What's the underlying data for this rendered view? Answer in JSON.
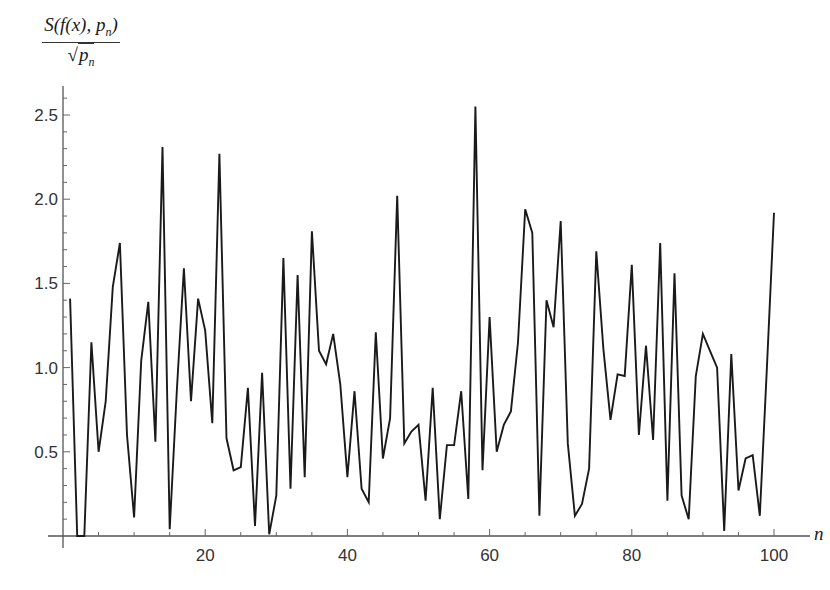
{
  "chart_data": {
    "type": "line",
    "title": "",
    "xlabel": "n",
    "ylabel": "S(f(x), p_n) / sqrt(p_n)",
    "ylabel_parts": {
      "numerator": "S(f(x), p",
      "numerator_sub": "n",
      "numerator_end": ")",
      "sqrt_symbol": "√",
      "denominator": "p",
      "denominator_sub": "n"
    },
    "xlim": [
      0,
      101
    ],
    "ylim": [
      0,
      2.7
    ],
    "x_ticks": [
      20,
      40,
      60,
      80,
      100
    ],
    "x_tick_labels": [
      "20",
      "40",
      "60",
      "80",
      "100"
    ],
    "y_ticks": [
      0.5,
      1.0,
      1.5,
      2.0,
      2.5
    ],
    "y_tick_labels": [
      "0.5",
      "1.0",
      "1.5",
      "2.0",
      "2.5"
    ],
    "grid": false,
    "legend": null,
    "series": [
      {
        "name": "S(f(x), p_n)/sqrt(p_n)",
        "color": "#1a1a1a",
        "x": [
          1,
          2,
          3,
          4,
          5,
          6,
          7,
          8,
          9,
          10,
          11,
          12,
          13,
          14,
          15,
          16,
          17,
          18,
          19,
          20,
          21,
          22,
          23,
          24,
          25,
          26,
          27,
          28,
          29,
          30,
          31,
          32,
          33,
          34,
          35,
          36,
          37,
          38,
          39,
          40,
          41,
          42,
          43,
          44,
          45,
          46,
          47,
          48,
          49,
          50,
          51,
          52,
          53,
          54,
          55,
          56,
          57,
          58,
          59,
          60,
          61,
          62,
          63,
          64,
          65,
          66,
          67,
          68,
          69,
          70,
          71,
          72,
          73,
          74,
          75,
          76,
          77,
          78,
          79,
          80,
          81,
          82,
          83,
          84,
          85,
          86,
          87,
          88,
          89,
          90,
          91,
          92,
          93,
          94,
          95,
          96,
          97,
          98,
          99,
          100
        ],
        "values": [
          1.41,
          0.0,
          0.0,
          1.15,
          0.5,
          0.8,
          1.48,
          1.74,
          0.6,
          0.11,
          1.04,
          1.39,
          0.56,
          2.31,
          0.04,
          0.86,
          1.59,
          0.8,
          1.41,
          1.22,
          0.67,
          2.27,
          0.58,
          0.39,
          0.41,
          0.88,
          0.06,
          0.97,
          0.01,
          0.24,
          1.65,
          0.28,
          1.55,
          0.35,
          1.81,
          1.1,
          1.02,
          1.2,
          0.9,
          0.35,
          0.86,
          0.28,
          0.2,
          1.21,
          0.46,
          0.7,
          2.02,
          0.55,
          0.62,
          0.66,
          0.21,
          0.88,
          0.1,
          0.54,
          0.54,
          0.86,
          0.22,
          2.55,
          0.39,
          1.3,
          0.5,
          0.66,
          0.74,
          1.15,
          1.94,
          1.8,
          0.12,
          1.4,
          1.24,
          1.87,
          0.55,
          0.12,
          0.19,
          0.4,
          1.69,
          1.11,
          0.69,
          0.96,
          0.95,
          1.61,
          0.6,
          1.13,
          0.57,
          1.74,
          0.21,
          1.56,
          0.24,
          0.1,
          0.95,
          1.2,
          1.1,
          1.0,
          0.03,
          1.08,
          0.27,
          0.46,
          0.48,
          0.12,
          1.0,
          1.92
        ]
      }
    ]
  }
}
